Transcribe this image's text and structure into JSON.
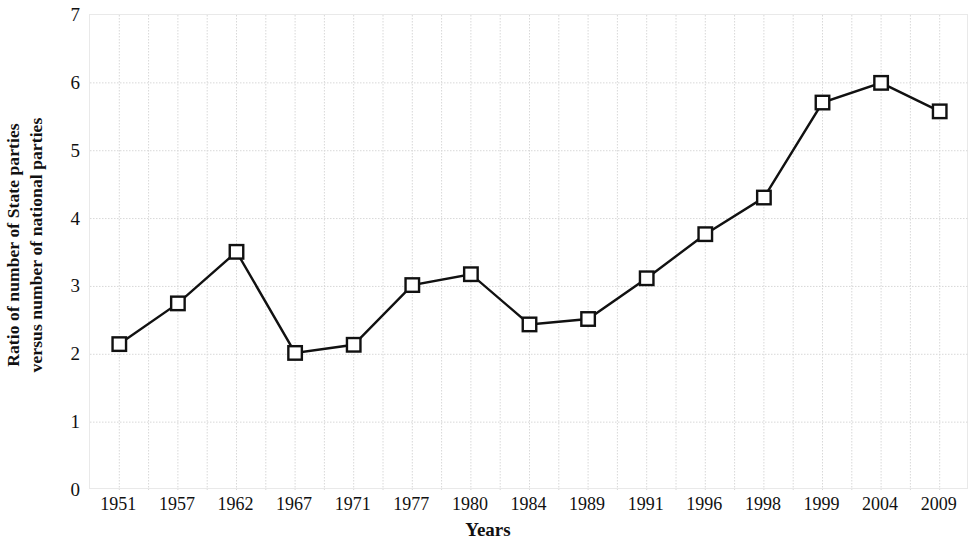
{
  "chart_data": {
    "type": "line",
    "title": "",
    "xlabel": "Years",
    "ylabel": "Ratio of number of State parties versus number of national parties",
    "ylabel_lines": [
      "Ratio of number of State parties",
      "versus number of national parties"
    ],
    "categories": [
      "1951",
      "1957",
      "1962",
      "1967",
      "1971",
      "1977",
      "1980",
      "1984",
      "1989",
      "1991",
      "1996",
      "1998",
      "1999",
      "2004",
      "2009"
    ],
    "values": [
      2.15,
      2.75,
      3.51,
      2.02,
      2.14,
      3.02,
      3.18,
      2.44,
      2.52,
      3.12,
      3.77,
      4.31,
      5.71,
      6.0,
      5.58
    ],
    "series": [
      {
        "name": "Ratio of number of State parties versus number of national parties",
        "values": [
          2.15,
          2.75,
          3.51,
          2.02,
          2.14,
          3.02,
          3.18,
          2.44,
          2.52,
          3.12,
          3.77,
          4.31,
          5.71,
          6.0,
          5.58
        ]
      }
    ],
    "yticks": [
      0,
      1,
      2,
      3,
      4,
      5,
      6,
      7
    ],
    "ytick_labels": [
      "0",
      "1",
      "2",
      "3",
      "4",
      "5",
      "6",
      "7"
    ],
    "ylim": [
      0,
      7
    ],
    "grid": true,
    "grid_color": "#d8d8d8",
    "legend": "none",
    "marker": "open-square",
    "marker_color": "#111111",
    "marker_fill": "#ffffff",
    "line_color": "#111111"
  },
  "axis": {
    "y_title_line1": "Ratio of number of State parties",
    "y_title_line2": "versus number of national parties",
    "x_title": "Years"
  }
}
